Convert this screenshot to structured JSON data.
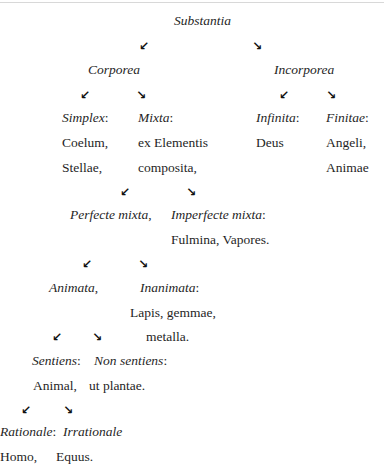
{
  "title": "Substantia",
  "arrows": {
    "down_left": "↙",
    "down_right": "↘"
  },
  "level1": {
    "left": "Corporea",
    "right": "Incorporea"
  },
  "corporea": {
    "simplex": {
      "label": "Simplex",
      "colon": ":",
      "items": [
        "Coelum,",
        "Stellae,"
      ]
    },
    "mixta": {
      "label": "Mixta",
      "colon": ":",
      "items": [
        "ex Elementis",
        "composita,"
      ]
    }
  },
  "incorporea": {
    "infinita": {
      "label": "Infinita",
      "colon": ":",
      "items": [
        "Deus"
      ]
    },
    "finitae": {
      "label": "Finitae",
      "colon": ":",
      "items": [
        "Angeli,",
        "Animae"
      ]
    }
  },
  "mixta_branch": {
    "perfecte": {
      "label": "Perfecte mixta",
      "suffix": ","
    },
    "imperfecte": {
      "label": "Imperfecte mixta",
      "colon": ":",
      "items": [
        "Fulmina, Vapores."
      ]
    }
  },
  "perfecte_branch": {
    "animata": {
      "label": "Animata",
      "suffix": ","
    },
    "inanimata": {
      "label": "Inanimata",
      "colon": ":",
      "items": [
        "Lapis, gemmae,",
        "metalla."
      ]
    }
  },
  "animata_branch": {
    "sentiens": {
      "label": "Sentiens",
      "colon": ":",
      "items": [
        "Animal,"
      ]
    },
    "non_sentiens": {
      "label": "Non sentiens",
      "colon": ":",
      "items": [
        "ut plantae."
      ]
    }
  },
  "sentiens_branch": {
    "rationale": {
      "label": "Rationale",
      "colon": ":",
      "items": [
        "Homo,"
      ]
    },
    "irrationale": {
      "label": "Irrationale",
      "items": [
        "Equus."
      ]
    }
  }
}
